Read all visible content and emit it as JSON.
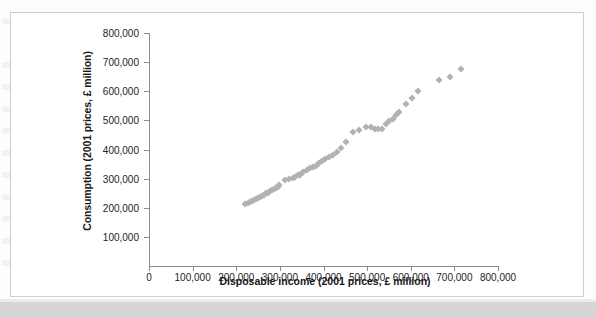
{
  "figure": {
    "background_color": "#ffffff",
    "border_color": "#cfcfd2",
    "marker_color": "#b2b2b6",
    "axis_color": "#8d8d91"
  },
  "chart_data": {
    "type": "scatter",
    "title": "",
    "xlabel": "Disposable income (2001 prices, £ million)",
    "ylabel": "Consumption (2001 prices, £ million)",
    "xlim": [
      0,
      800000
    ],
    "ylim": [
      0,
      800000
    ],
    "grid": false,
    "legend": null,
    "xticks": [
      0,
      100000,
      200000,
      300000,
      400000,
      500000,
      600000,
      700000,
      800000
    ],
    "xtick_labels": [
      "0",
      "100,000",
      "200,000",
      "300,000",
      "400,000",
      "500,000",
      "600,000",
      "700,000",
      "800,000"
    ],
    "yticks": [
      100000,
      200000,
      300000,
      400000,
      500000,
      600000,
      700000,
      800000
    ],
    "ytick_labels": [
      "100,000",
      "200,000",
      "300,000",
      "400,000",
      "500,000",
      "600,000",
      "700,000",
      "800,000"
    ],
    "marker": "diamond",
    "points": [
      [
        220000,
        212000
      ],
      [
        226000,
        215000
      ],
      [
        231000,
        219000
      ],
      [
        236000,
        223000
      ],
      [
        241000,
        227000
      ],
      [
        246000,
        231000
      ],
      [
        250000,
        234000
      ],
      [
        255000,
        238000
      ],
      [
        259000,
        241000
      ],
      [
        263000,
        245000
      ],
      [
        268000,
        249000
      ],
      [
        272000,
        252000
      ],
      [
        277000,
        256000
      ],
      [
        281000,
        260000
      ],
      [
        286000,
        264000
      ],
      [
        290000,
        268000
      ],
      [
        295000,
        272000
      ],
      [
        299000,
        277000
      ],
      [
        312000,
        296000
      ],
      [
        320000,
        300000
      ],
      [
        329000,
        303000
      ],
      [
        335000,
        307000
      ],
      [
        341000,
        311000
      ],
      [
        347000,
        314000
      ],
      [
        354000,
        322000
      ],
      [
        362000,
        330000
      ],
      [
        369000,
        337000
      ],
      [
        376000,
        341000
      ],
      [
        383000,
        345000
      ],
      [
        390000,
        352000
      ],
      [
        397000,
        360000
      ],
      [
        404000,
        366000
      ],
      [
        413000,
        374000
      ],
      [
        421000,
        381000
      ],
      [
        430000,
        390000
      ],
      [
        441000,
        406000
      ],
      [
        452000,
        427000
      ],
      [
        468000,
        459000
      ],
      [
        481000,
        466000
      ],
      [
        497000,
        476000
      ],
      [
        508000,
        478000
      ],
      [
        517000,
        472000
      ],
      [
        525000,
        470000
      ],
      [
        533000,
        472000
      ],
      [
        543000,
        487000
      ],
      [
        551000,
        497000
      ],
      [
        559000,
        505000
      ],
      [
        566000,
        517000
      ],
      [
        574000,
        530000
      ],
      [
        589000,
        556000
      ],
      [
        602000,
        578000
      ],
      [
        616000,
        601000
      ],
      [
        664000,
        637000
      ],
      [
        689000,
        650000
      ],
      [
        715000,
        677000
      ]
    ]
  }
}
